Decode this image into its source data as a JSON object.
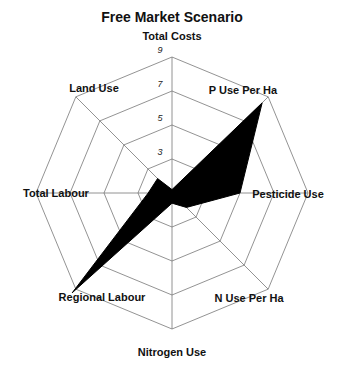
{
  "chart_data": {
    "type": "radar",
    "title": "Free Market Scenario",
    "categories": [
      "Total Costs",
      "P Use Per Ha",
      "Pesticide Use",
      "N Use Per Ha",
      "Nitrogen Use",
      "Regional Labour",
      "Total Labour",
      "Land Use"
    ],
    "series": [
      {
        "name": "Free Market Scenario",
        "values": [
          1.2,
          8.5,
          5.0,
          2.2,
          1.6,
          9.3,
          2.4,
          2.2
        ],
        "color": "#000000"
      }
    ],
    "rlim": [
      1,
      9
    ],
    "ticks": [
      3,
      5,
      7,
      9
    ],
    "tick_labels": [
      "3",
      "5",
      "7",
      "9"
    ],
    "grid": true,
    "grid_shape": "octagon",
    "legend": "none"
  }
}
